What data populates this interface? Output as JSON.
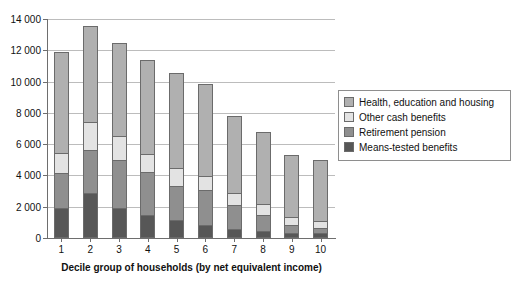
{
  "chart_data": {
    "type": "bar",
    "stacked": true,
    "title": "",
    "xlabel": "Decile group of households (by net equivalent income)",
    "ylabel": "",
    "ylim": [
      0,
      14000
    ],
    "ytick_step": 2000,
    "ytick_labels": [
      "0",
      "2 000",
      "4 000",
      "6 000",
      "8 000",
      "10 000",
      "12 000",
      "14 000"
    ],
    "ytick_values": [
      0,
      2000,
      4000,
      6000,
      8000,
      10000,
      12000,
      14000
    ],
    "grid": "horizontal",
    "legend_position": "right",
    "categories": [
      "1",
      "2",
      "3",
      "4",
      "5",
      "6",
      "7",
      "8",
      "9",
      "10"
    ],
    "series": [
      {
        "name": "Means-tested benefits",
        "color": "#575757",
        "values": [
          1950,
          2900,
          1900,
          1500,
          1150,
          850,
          600,
          450,
          350,
          300
        ]
      },
      {
        "name": "Retirement pension",
        "color": "#8f8f8f",
        "values": [
          2200,
          2700,
          3100,
          2750,
          2200,
          2200,
          1500,
          1000,
          500,
          350
        ]
      },
      {
        "name": "Other cash benefits",
        "color": "#e3e3e3",
        "values": [
          1300,
          1800,
          1500,
          1150,
          1100,
          900,
          750,
          700,
          500,
          450
        ]
      },
      {
        "name": "Health, education and housing",
        "color": "#b0b0b0",
        "values": [
          6430,
          6170,
          6000,
          5950,
          6100,
          5900,
          4950,
          4600,
          3950,
          3900
        ]
      }
    ],
    "totals": [
      11880,
      13570,
      12500,
      11350,
      10550,
      9850,
      7800,
      6750,
      5300,
      5000
    ]
  },
  "legend": {
    "items": [
      {
        "label": "Health, education and housing",
        "color": "#b0b0b0"
      },
      {
        "label": "Other cash benefits",
        "color": "#e3e3e3"
      },
      {
        "label": "Retirement pension",
        "color": "#8f8f8f"
      },
      {
        "label": "Means-tested benefits",
        "color": "#575757"
      }
    ]
  },
  "axes": {
    "x_title": "Decile group of households (by net equivalent income)"
  }
}
